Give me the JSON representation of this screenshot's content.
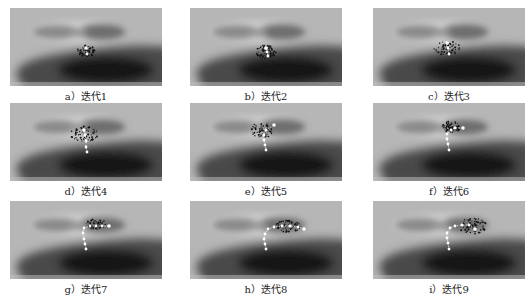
{
  "figure": {
    "background_color": "#b4b4b4",
    "panels": [
      {
        "id": "a",
        "caption": "a）迭代1",
        "iteration": 1,
        "left": 10,
        "top": 8,
        "swarm": {
          "cx": 76,
          "cy": 43,
          "rx": 9,
          "ry": 6
        },
        "path": [
          [
            76,
            40
          ],
          [
            77,
            46
          ]
        ]
      },
      {
        "id": "b",
        "caption": "b）迭代2",
        "iteration": 2,
        "left": 190,
        "top": 8,
        "swarm": {
          "cx": 76,
          "cy": 44,
          "rx": 10,
          "ry": 7
        },
        "path": [
          [
            76,
            40
          ],
          [
            77,
            44
          ],
          [
            78,
            48
          ]
        ]
      },
      {
        "id": "c",
        "caption": "c）迭代3",
        "iteration": 3,
        "left": 373,
        "top": 8,
        "swarm": {
          "cx": 74,
          "cy": 40,
          "rx": 13,
          "ry": 7
        },
        "path": [
          [
            74,
            35
          ],
          [
            75,
            40
          ],
          [
            76,
            46
          ]
        ]
      },
      {
        "id": "d",
        "caption": "d）迭代4",
        "iteration": 4,
        "left": 10,
        "top": 103,
        "swarm": {
          "cx": 74,
          "cy": 31,
          "rx": 14,
          "ry": 8
        },
        "path": [
          [
            74,
            27
          ],
          [
            75,
            32
          ],
          [
            76,
            38
          ],
          [
            76,
            44
          ],
          [
            77,
            49
          ]
        ]
      },
      {
        "id": "e",
        "caption": "e）迭代5",
        "iteration": 5,
        "left": 190,
        "top": 103,
        "swarm": {
          "cx": 72,
          "cy": 27,
          "rx": 11,
          "ry": 8
        },
        "path": [
          [
            84,
            22
          ],
          [
            76,
            27
          ],
          [
            74,
            32
          ],
          [
            74,
            37
          ],
          [
            75,
            42
          ],
          [
            76,
            47
          ]
        ]
      },
      {
        "id": "f",
        "caption": "f）迭代6",
        "iteration": 6,
        "left": 373,
        "top": 103,
        "swarm": {
          "cx": 78,
          "cy": 24,
          "rx": 9,
          "ry": 6
        },
        "path": [
          [
            90,
            25
          ],
          [
            82,
            25
          ],
          [
            78,
            27
          ],
          [
            74,
            31
          ],
          [
            74,
            36
          ],
          [
            75,
            41
          ],
          [
            76,
            47
          ]
        ]
      },
      {
        "id": "g",
        "caption": "g）迭代7",
        "iteration": 7,
        "left": 10,
        "top": 201,
        "swarm": {
          "cx": 86,
          "cy": 23,
          "rx": 10,
          "ry": 5
        },
        "path": [
          [
            99,
            25
          ],
          [
            92,
            25
          ],
          [
            86,
            25
          ],
          [
            80,
            25
          ],
          [
            74,
            27
          ],
          [
            73,
            32
          ],
          [
            74,
            38
          ],
          [
            75,
            43
          ],
          [
            76,
            48
          ]
        ]
      },
      {
        "id": "h",
        "caption": "h）迭代8",
        "iteration": 8,
        "left": 190,
        "top": 201,
        "swarm": {
          "cx": 98,
          "cy": 25,
          "rx": 13,
          "ry": 6
        },
        "path": [
          [
            114,
            28
          ],
          [
            108,
            26
          ],
          [
            100,
            25
          ],
          [
            92,
            25
          ],
          [
            84,
            26
          ],
          [
            78,
            28
          ],
          [
            75,
            33
          ],
          [
            74,
            38
          ],
          [
            75,
            43
          ],
          [
            76,
            48
          ]
        ]
      },
      {
        "id": "i",
        "caption": "i）迭代9",
        "iteration": 9,
        "left": 373,
        "top": 201,
        "swarm": {
          "cx": 100,
          "cy": 25,
          "rx": 14,
          "ry": 8
        },
        "path": [
          [
            102,
            28
          ],
          [
            96,
            24
          ],
          [
            89,
            24
          ],
          [
            82,
            25
          ],
          [
            77,
            27
          ],
          [
            74,
            32
          ],
          [
            74,
            37
          ],
          [
            75,
            42
          ],
          [
            76,
            48
          ]
        ]
      }
    ]
  }
}
